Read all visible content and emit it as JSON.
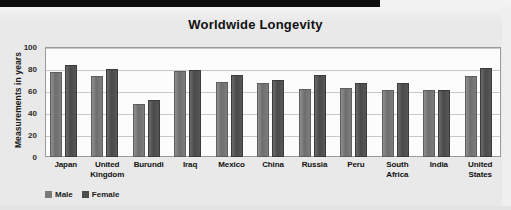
{
  "chart_data": {
    "type": "bar",
    "title": "Worldwide Longevity",
    "xlabel": "",
    "ylabel": "Measurements in years",
    "ylim": [
      0,
      100
    ],
    "yticks": [
      0,
      20,
      40,
      60,
      80,
      100
    ],
    "grid": true,
    "legend_position": "bottom-left",
    "categories": [
      "Japan",
      "United Kingdom",
      "Burundi",
      "Iraq",
      "Mexico",
      "China",
      "Russia",
      "Peru",
      "South Africa",
      "India",
      "United States"
    ],
    "series": [
      {
        "name": "Male",
        "color": "#7a7a7a",
        "values": [
          77,
          74,
          48,
          78,
          68,
          67,
          62,
          63,
          61,
          61,
          74
        ]
      },
      {
        "name": "Female",
        "color": "#4d4d4d",
        "values": [
          84,
          80,
          52,
          79,
          75,
          70,
          75,
          67,
          67,
          61,
          81
        ]
      }
    ]
  },
  "colors": {
    "banner": "#0d0d0d",
    "background": "#e9e9e9",
    "plot_background": "#fcfcfc",
    "gridline": "#c9c9c9",
    "text": "#111111"
  }
}
